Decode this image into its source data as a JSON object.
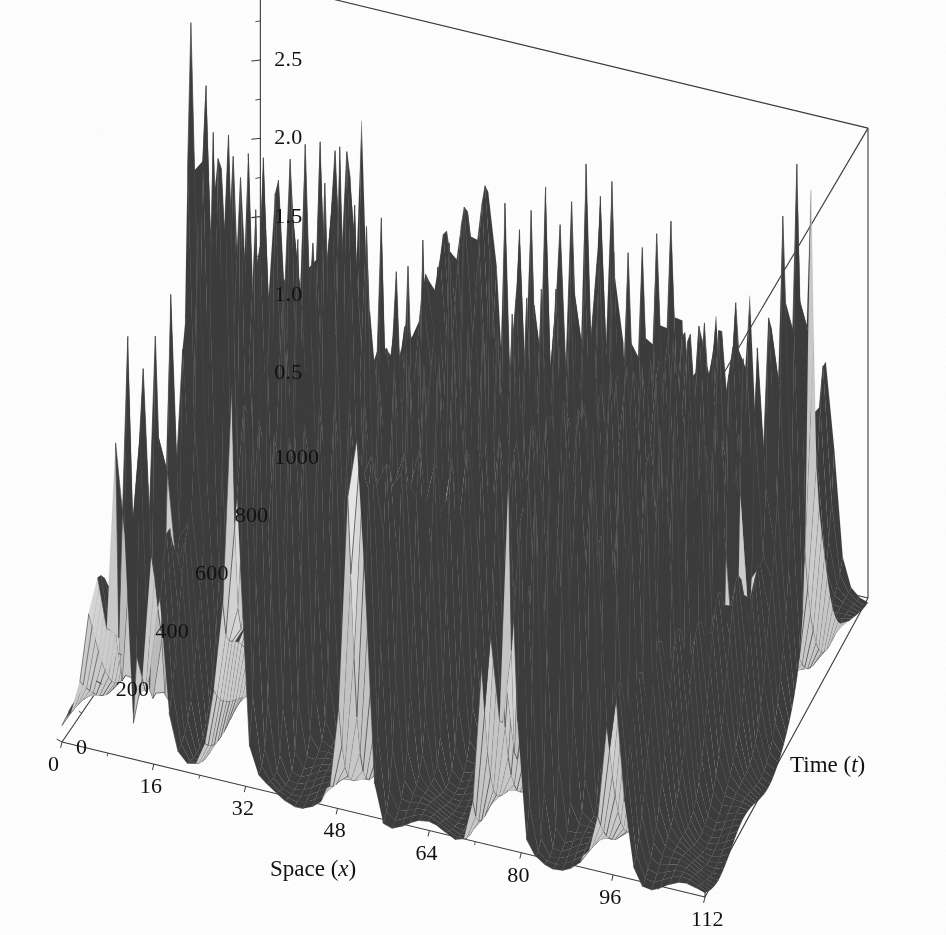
{
  "figure": {
    "kind": "3d-surface-mesh",
    "background_color": "#ffffff",
    "axis_line_color": "#3a3a3a",
    "mesh_line_color": "#4a4a4a",
    "surface_fill_light": "#e8e8e8",
    "surface_fill_dark": "#4e4e4e",
    "underside_fill": "#3c3c3c",
    "text_color": "#111111"
  },
  "axes": {
    "x": {
      "title_prefix": "Space (",
      "title_var": "x",
      "title_suffix": ")",
      "title_full": "Space (x)",
      "min": 0,
      "max": 112,
      "ticks": [
        0,
        16,
        32,
        48,
        64,
        80,
        96,
        112
      ],
      "tick_labels": [
        "0",
        "16",
        "32",
        "48",
        "64",
        "80",
        "96",
        "112"
      ],
      "minor_ticks_between": 1
    },
    "y": {
      "title_prefix": "Time (",
      "title_var": "t",
      "title_suffix": ")",
      "title_full": "Time (t)",
      "min": 0,
      "max": 1000,
      "ticks": [
        0,
        200,
        400,
        600,
        800,
        1000
      ],
      "tick_labels": [
        "0",
        "200",
        "400",
        "600",
        "800",
        "1000"
      ],
      "minor_ticks_between": 1
    },
    "z": {
      "title_full": "",
      "min": 0,
      "max": 3.0,
      "ticks": [
        0.5,
        1.0,
        1.5,
        2.0,
        2.5,
        3.0
      ],
      "tick_labels": [
        "0.5",
        "1.0",
        "1.5",
        "2.0",
        "2.5",
        "3.0"
      ],
      "minor_ticks_between": 1
    }
  },
  "chart_data": {
    "type": "surface",
    "title": "",
    "xlabel": "Space (x)",
    "ylabel": "Time (t)",
    "zlabel": "",
    "xlim": [
      0,
      112
    ],
    "ylim": [
      0,
      1000
    ],
    "zlim": [
      0,
      3.0
    ],
    "grid": true,
    "legend": "none",
    "mesh_samples": {
      "nx": 72,
      "nt": 60
    },
    "view": {
      "azimuth_deg": -62,
      "elevation_deg": 24
    },
    "z_peak_observed": 2.6,
    "solitons": [
      {
        "amplitude": 2.45,
        "width": 1.05,
        "x0": 10,
        "speed": 0.056,
        "note": "fast tall right-travelling"
      },
      {
        "amplitude": 2.1,
        "width": 1.25,
        "x0": 30,
        "speed": 0.047
      },
      {
        "amplitude": 1.75,
        "width": 1.45,
        "x0": 52,
        "speed": 0.038
      },
      {
        "amplitude": 1.45,
        "width": 1.7,
        "x0": 74,
        "speed": 0.0305
      },
      {
        "amplitude": 1.15,
        "width": 2.0,
        "x0": 96,
        "speed": 0.0235
      },
      {
        "amplitude": 0.95,
        "width": 2.3,
        "x0": 118,
        "speed": 0.018
      },
      {
        "amplitude": 2.25,
        "width": 1.15,
        "x0": -34,
        "speed": 0.0525
      },
      {
        "amplitude": 1.6,
        "width": 1.55,
        "x0": -62,
        "speed": 0.034
      },
      {
        "amplitude": 1.3,
        "width": 1.85,
        "x0": -96,
        "speed": 0.0265
      },
      {
        "amplitude": 0.8,
        "width": 2.6,
        "x0": 140,
        "speed": 0.014
      }
    ],
    "background_ripple": {
      "amplitude": 0.055,
      "kx": 0.42,
      "kt": 0.02
    },
    "plateau": {
      "x_range": [
        0,
        18
      ],
      "z_level": 0.08
    }
  }
}
